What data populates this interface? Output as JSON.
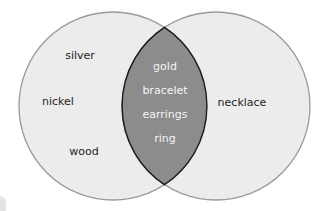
{
  "diagram": {
    "type": "venn",
    "sets": [
      {
        "name": "left-set",
        "only_items": [
          "silver",
          "nickel",
          "wood"
        ]
      },
      {
        "name": "right-set",
        "only_items": [
          "necklace"
        ]
      }
    ],
    "intersection": {
      "items": [
        "gold",
        "bracelet",
        "earrings",
        "ring"
      ]
    },
    "labels": {
      "left": {
        "silver": "silver",
        "nickel": "nickel",
        "wood": "wood"
      },
      "right": {
        "necklace": "necklace"
      },
      "intersection": {
        "gold": "gold",
        "bracelet": "bracelet",
        "earrings": "earrings",
        "ring": "ring"
      }
    },
    "colors": {
      "circle_fill": "#ececec",
      "circle_stroke": "#9a9a9a",
      "intersection_fill": "#8c8c8c",
      "intersection_stroke": "#1a1a1a",
      "outer_text": "#1e1e1e",
      "inner_text": "#f4f4f4"
    }
  }
}
